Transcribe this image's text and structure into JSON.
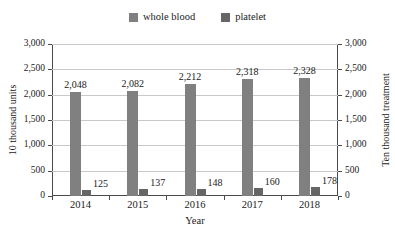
{
  "chart_data": {
    "type": "bar",
    "title": "",
    "categories": [
      "2014",
      "2015",
      "2016",
      "2017",
      "2018"
    ],
    "series": [
      {
        "name": "whole blood",
        "values": [
          2048,
          2082,
          2212,
          2318,
          2328
        ],
        "labels": [
          "2,048",
          "2,082",
          "2,212",
          "2,318",
          "2,328"
        ],
        "color": "#808080",
        "axis": "left"
      },
      {
        "name": "platelet",
        "values": [
          125,
          137,
          148,
          160,
          178
        ],
        "labels": [
          "125",
          "137",
          "148",
          "160",
          "178"
        ],
        "color": "#666666",
        "axis": "right"
      }
    ],
    "xlabel": "Year",
    "ylabel": "10 thousand units",
    "ylabel_right": "Ten thousand treatment",
    "ylim": [
      0,
      3000
    ],
    "ylim_right": [
      0,
      3000
    ],
    "ytick_labels": [
      "3,000",
      "2,500",
      "2,000",
      "1,500",
      "1,000",
      "500",
      "0"
    ],
    "ytick_values": [
      3000,
      2500,
      2000,
      1500,
      1000,
      500,
      0
    ],
    "ytick_labels_right": [
      "3,000",
      "2,500",
      "2,000",
      "1,500",
      "1,000",
      "500",
      "0"
    ],
    "grid": true,
    "legend_position": "top-center"
  },
  "legend": {
    "items": [
      {
        "label": "whole blood",
        "color": "#808080"
      },
      {
        "label": "platelet",
        "color": "#666666"
      }
    ]
  },
  "axes": {
    "x_title": "Year",
    "y_left_title": "10 thousand units",
    "y_right_title": "Ten thousand treatment"
  }
}
